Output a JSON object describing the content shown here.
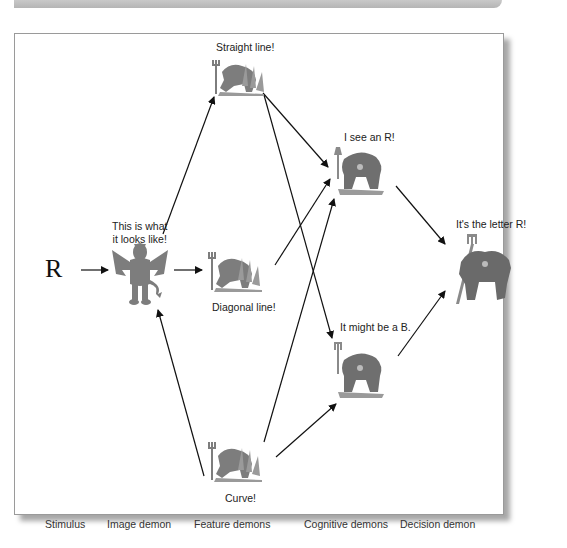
{
  "diagram": {
    "stimulus": "R",
    "speech": {
      "image_demon_line1": "This is what",
      "image_demon_line2": "it looks like!",
      "feature_straight": "Straight line!",
      "feature_diagonal": "Diagonal line!",
      "feature_curve": "Curve!",
      "cognitive_r": "I see an R!",
      "cognitive_b": "It might be a B.",
      "decision": "It's the letter R!"
    },
    "columns": [
      {
        "label": "Stimulus"
      },
      {
        "label": "Image demon"
      },
      {
        "label": "Feature demons"
      },
      {
        "label": "Cognitive demons"
      },
      {
        "label": "Decision demon"
      }
    ],
    "icons": {
      "image_demon": "winged-devil-icon",
      "feature_demon": "devil-with-pitchfork-icon",
      "cognitive_demon": "devil-with-pitchfork-icon",
      "decision_demon": "large-devil-with-pitchfork-icon"
    },
    "colors": {
      "demon_fill": "#7a7a7a",
      "arrow": "#111111",
      "frame_border": "#9a9a9a"
    }
  }
}
